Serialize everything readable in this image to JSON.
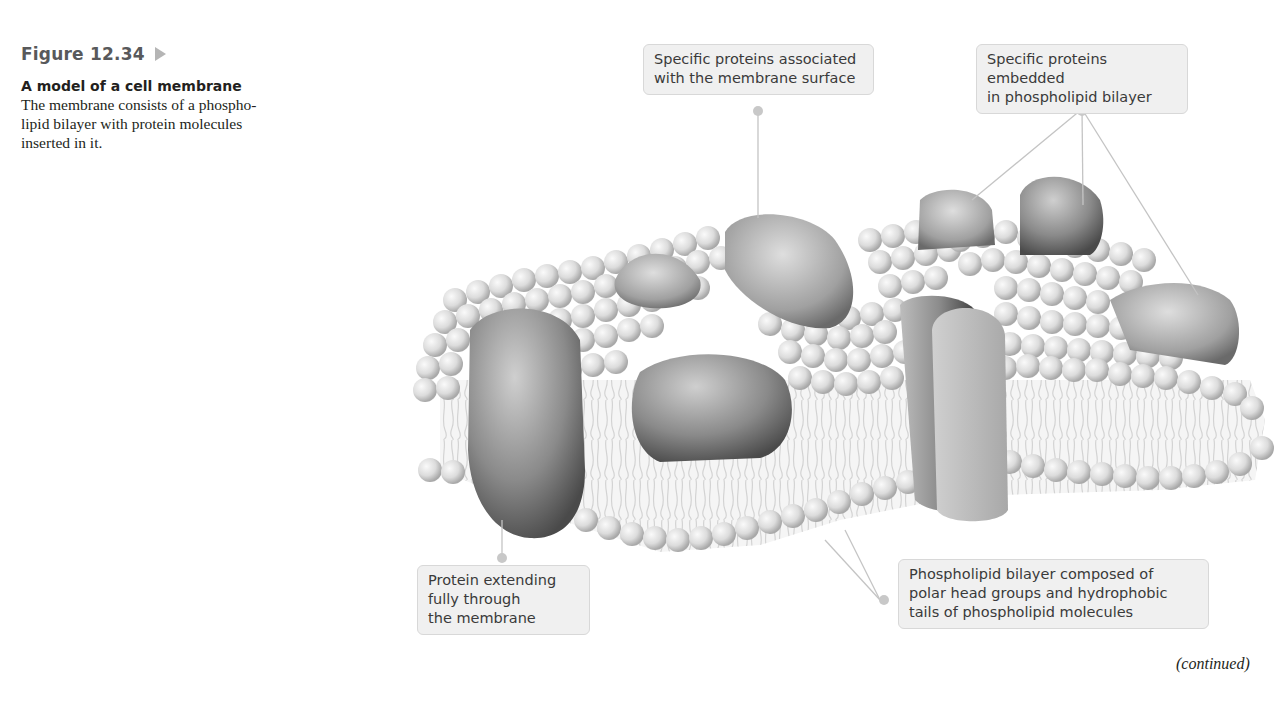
{
  "figure": {
    "number": "Figure 12.34",
    "arrow_icon": "triangle-right-icon",
    "title": "A model of a cell membrane"
  },
  "description_lines": [
    "The membrane consists of a phospho-",
    "lipid bilayer with protein molecules",
    "inserted in it."
  ],
  "labels": {
    "surface_proteins": [
      "Specific proteins associated",
      "with the membrane surface"
    ],
    "embedded_proteins": [
      "Specific proteins embedded",
      "in phospholipid bilayer"
    ],
    "transmembrane_protein": [
      "Protein extending",
      "fully through",
      "the membrane"
    ],
    "bilayer": [
      "Phospholipid bilayer composed of",
      "polar head groups and hydrophobic",
      "tails of phospholipid molecules"
    ]
  },
  "footer": {
    "continued": "(continued)"
  },
  "colors": {
    "label_bg": "#f0f0f0",
    "leader_line": "#c4c4c4",
    "sphere_light": "#f2f2f2",
    "sphere_dark": "#a8a8a8",
    "protein_dark": "#5a5a5a"
  }
}
